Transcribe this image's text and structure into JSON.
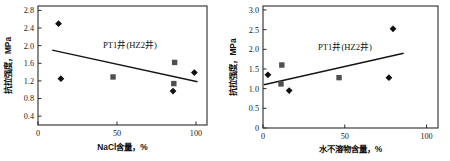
{
  "figure": {
    "background_color": "#ffffff",
    "panel_count": 2
  },
  "chart_data": [
    {
      "id": "left",
      "type": "scatter",
      "title": "",
      "annotation": "PT1井(HZ2井)",
      "xlabel": "NaCl含量，%",
      "ylabel": "抗拉强度，MPa",
      "xlim": [
        0,
        107
      ],
      "ylim": [
        0.2,
        2.9
      ],
      "grid": false,
      "legend": "none",
      "xticks": [
        0,
        50,
        100
      ],
      "xtick_labels": [
        "0",
        "50",
        "100"
      ],
      "yticks": [
        0.4,
        0.8,
        1.2,
        1.6,
        2.0,
        2.4,
        2.8
      ],
      "ytick_labels": [
        "0.4",
        "0.8",
        "1.2",
        "1.6",
        "2.0",
        "2.4",
        "2.8"
      ],
      "series": [
        {
          "name": "PT1井",
          "marker": "diamond",
          "color": "#101010",
          "points": [
            {
              "x": 13.0,
              "y": 2.5
            },
            {
              "x": 14.5,
              "y": 1.25
            },
            {
              "x": 85.5,
              "y": 0.97
            },
            {
              "x": 99.0,
              "y": 1.39
            }
          ]
        },
        {
          "name": "HZ2井",
          "marker": "square",
          "color": "#4f4f4f",
          "points": [
            {
              "x": 47.5,
              "y": 1.29
            },
            {
              "x": 86.5,
              "y": 1.62
            },
            {
              "x": 86.0,
              "y": 1.14
            }
          ]
        }
      ],
      "trend": {
        "x_start": 9.0,
        "y_start": 1.9,
        "x_end": 101.0,
        "y_end": 1.18
      }
    },
    {
      "id": "right",
      "type": "scatter",
      "title": "",
      "annotation": "PT1井(HZ2井)",
      "xlabel": "水不溶物含量，%",
      "ylabel": "抗拉强度，MPa",
      "xlim": [
        0,
        107
      ],
      "ylim": [
        0,
        3.1
      ],
      "grid": false,
      "legend": "none",
      "xticks": [
        0,
        50,
        100
      ],
      "xtick_labels": [
        "0",
        "50",
        "100"
      ],
      "yticks": [
        0,
        0.5,
        1.0,
        1.5,
        2.0,
        2.5,
        3.0
      ],
      "ytick_labels": [
        "0",
        "0.5",
        "1.0",
        "1.5",
        "2.0",
        "2.5",
        "3.0"
      ],
      "series": [
        {
          "name": "PT1井",
          "marker": "diamond",
          "color": "#101010",
          "points": [
            {
              "x": 3.0,
              "y": 1.35
            },
            {
              "x": 16.0,
              "y": 0.95
            },
            {
              "x": 79.5,
              "y": 2.52
            },
            {
              "x": 77.0,
              "y": 1.28
            }
          ]
        },
        {
          "name": "HZ2井",
          "marker": "square",
          "color": "#4f4f4f",
          "points": [
            {
              "x": 11.5,
              "y": 1.6
            },
            {
              "x": 11.0,
              "y": 1.12
            },
            {
              "x": 46.5,
              "y": 1.28
            }
          ]
        }
      ],
      "trend": {
        "x_start": 0.5,
        "y_start": 1.1,
        "x_end": 86.0,
        "y_end": 1.9
      }
    }
  ]
}
